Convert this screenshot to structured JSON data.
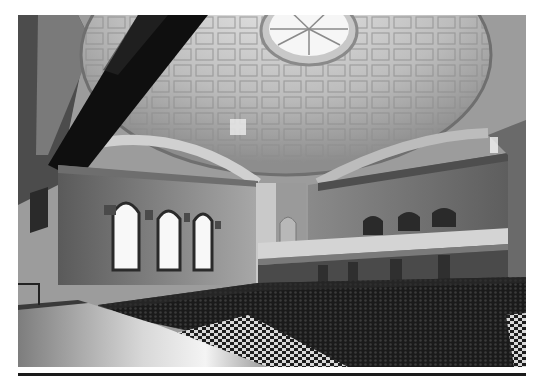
{
  "figure": {
    "elements": [
      "coffered-dome-ceiling",
      "skylight-oculus",
      "suspended-lighting-truss",
      "arched-windows",
      "balcony",
      "audience-seating",
      "checkered-floor",
      "stage"
    ],
    "window_count_left": 3,
    "balcony_arch_count": 3
  },
  "caption": {
    "text": ""
  },
  "colors": {
    "page_background": "#ffffff",
    "rule": "#1a1a1a"
  }
}
